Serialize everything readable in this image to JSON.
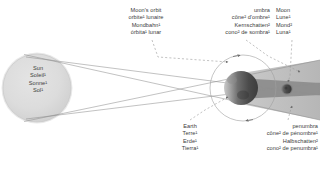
{
  "diagram": {
    "background_color": "#ffffff",
    "text_color": "#3b3b3b"
  },
  "labels": {
    "sun": {
      "name": "sun-label",
      "lines": [
        "Sun",
        "Soleil¹",
        "Sonne¹",
        "Sol¹"
      ]
    },
    "moons_orbit": {
      "name": "moons-orbit-label",
      "lines": [
        "Moon's orbit",
        "orbite¹ lunaire",
        "Mondbahn¹",
        "órbita¹ lunar"
      ]
    },
    "umbra": {
      "name": "umbra-label",
      "lines": [
        "umbra",
        "cône² d'ombre¹",
        "Kernschatten²",
        "cono² de sombra¹"
      ]
    },
    "moon": {
      "name": "moon-label",
      "lines": [
        "Moon",
        "Lune¹",
        "Mond²",
        "Luna¹"
      ]
    },
    "earth": {
      "name": "earth-label",
      "lines": [
        "Earth",
        "Terre¹",
        "Erde¹",
        "Tierra¹"
      ]
    },
    "penumbra": {
      "name": "penumbra-label",
      "lines": [
        "penumbra",
        "cône² de pénombre¹",
        "Halbschatten²",
        "cono² de penumbra¹"
      ]
    }
  },
  "colors": {
    "sun_fill": "#d8d8d8",
    "sun_edge": "#c4c4c4",
    "penumbra_fill": "#b9b9b9",
    "umbra_fill": "#8f8f8f",
    "earth_dark": "#4a4a4a",
    "earth_light": "#d0d0d0",
    "moon_body": "#3f3f3f",
    "orbit_stroke": "#9a9a9a",
    "ray_stroke": "#8c8c8c",
    "leader_stroke": "#9a9a9a"
  },
  "bodies": {
    "sun": {
      "name": "sun-body",
      "cx": 37,
      "cy": 88,
      "r": 34
    },
    "earth": {
      "name": "earth-body",
      "cx": 241,
      "cy": 88,
      "r": 17
    },
    "moon": {
      "name": "moon-body",
      "cx": 287,
      "cy": 89,
      "r": 5.4
    },
    "moon_orbit": {
      "name": "moon-orbit-path",
      "cx": 243,
      "cy": 88,
      "rx": 33,
      "ry": 33
    }
  }
}
